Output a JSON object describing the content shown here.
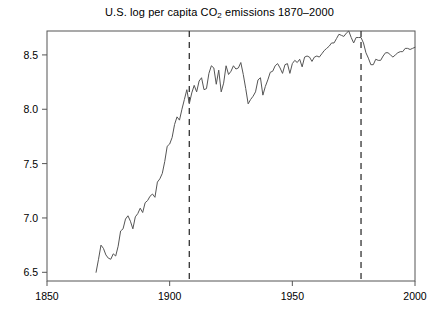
{
  "chart_data": {
    "type": "line",
    "title_prefix": "U.S. log per capita CO",
    "title_subscript": "2",
    "title_suffix": " emissions 1870–2000",
    "xlabel": "",
    "ylabel": "",
    "xlim": [
      1850,
      2000
    ],
    "ylim": [
      6.42,
      8.72
    ],
    "xticks": [
      1850,
      1900,
      1950,
      2000
    ],
    "xtick_labels": [
      "1850",
      "1900",
      "1950",
      "2000"
    ],
    "yticks": [
      6.5,
      7.0,
      7.5,
      8.0,
      8.5
    ],
    "ytick_labels": [
      "6.5",
      "7.0",
      "7.5",
      "8.0",
      "8.5"
    ],
    "grid": false,
    "legend": null,
    "line_color": "#555555",
    "axis_color": "#555555",
    "annotations": [
      {
        "type": "vline",
        "x": 1908,
        "style": "dashed",
        "color": "#333333"
      },
      {
        "type": "vline",
        "x": 1978,
        "style": "dashed",
        "color": "#333333"
      }
    ],
    "x": [
      1870,
      1871,
      1872,
      1873,
      1874,
      1875,
      1876,
      1877,
      1878,
      1879,
      1880,
      1881,
      1882,
      1883,
      1884,
      1885,
      1886,
      1887,
      1888,
      1889,
      1890,
      1891,
      1892,
      1893,
      1894,
      1895,
      1896,
      1897,
      1898,
      1899,
      1900,
      1901,
      1902,
      1903,
      1904,
      1905,
      1906,
      1907,
      1908,
      1909,
      1910,
      1911,
      1912,
      1913,
      1914,
      1915,
      1916,
      1917,
      1918,
      1919,
      1920,
      1921,
      1922,
      1923,
      1924,
      1925,
      1926,
      1927,
      1928,
      1929,
      1930,
      1931,
      1932,
      1933,
      1934,
      1935,
      1936,
      1937,
      1938,
      1939,
      1940,
      1941,
      1942,
      1943,
      1944,
      1945,
      1946,
      1947,
      1948,
      1949,
      1950,
      1951,
      1952,
      1953,
      1954,
      1955,
      1956,
      1957,
      1958,
      1959,
      1960,
      1961,
      1962,
      1963,
      1964,
      1965,
      1966,
      1967,
      1968,
      1969,
      1970,
      1971,
      1972,
      1973,
      1974,
      1975,
      1976,
      1977,
      1978,
      1979,
      1980,
      1981,
      1982,
      1983,
      1984,
      1985,
      1986,
      1987,
      1988,
      1989,
      1990,
      1991,
      1992,
      1993,
      1994,
      1995,
      1996,
      1997,
      1998,
      1999,
      2000
    ],
    "y": [
      6.5,
      6.62,
      6.75,
      6.72,
      6.66,
      6.63,
      6.62,
      6.67,
      6.65,
      6.74,
      6.88,
      6.9,
      6.99,
      7.02,
      6.97,
      6.9,
      7.01,
      7.04,
      7.09,
      7.05,
      7.14,
      7.16,
      7.2,
      7.22,
      7.19,
      7.33,
      7.36,
      7.41,
      7.52,
      7.66,
      7.68,
      7.74,
      7.86,
      7.93,
      7.9,
      8.0,
      8.09,
      8.18,
      8.05,
      8.15,
      8.22,
      8.16,
      8.26,
      8.29,
      8.18,
      8.19,
      8.33,
      8.4,
      8.38,
      8.23,
      8.36,
      8.16,
      8.24,
      8.4,
      8.32,
      8.35,
      8.4,
      8.37,
      8.38,
      8.43,
      8.32,
      8.19,
      8.05,
      8.09,
      8.12,
      8.16,
      8.27,
      8.29,
      8.13,
      8.21,
      8.27,
      8.34,
      8.35,
      8.4,
      8.42,
      8.38,
      8.33,
      8.41,
      8.42,
      8.33,
      8.42,
      8.45,
      8.43,
      8.46,
      8.39,
      8.48,
      8.49,
      8.48,
      8.44,
      8.48,
      8.49,
      8.48,
      8.51,
      8.54,
      8.56,
      8.58,
      8.61,
      8.61,
      8.65,
      8.69,
      8.68,
      8.67,
      8.7,
      8.72,
      8.66,
      8.61,
      8.66,
      8.66,
      8.66,
      8.61,
      8.52,
      8.47,
      8.41,
      8.41,
      8.46,
      8.45,
      8.45,
      8.49,
      8.52,
      8.52,
      8.5,
      8.48,
      8.5,
      8.52,
      8.53,
      8.53,
      8.56,
      8.56,
      8.55,
      8.56,
      8.57
    ]
  }
}
